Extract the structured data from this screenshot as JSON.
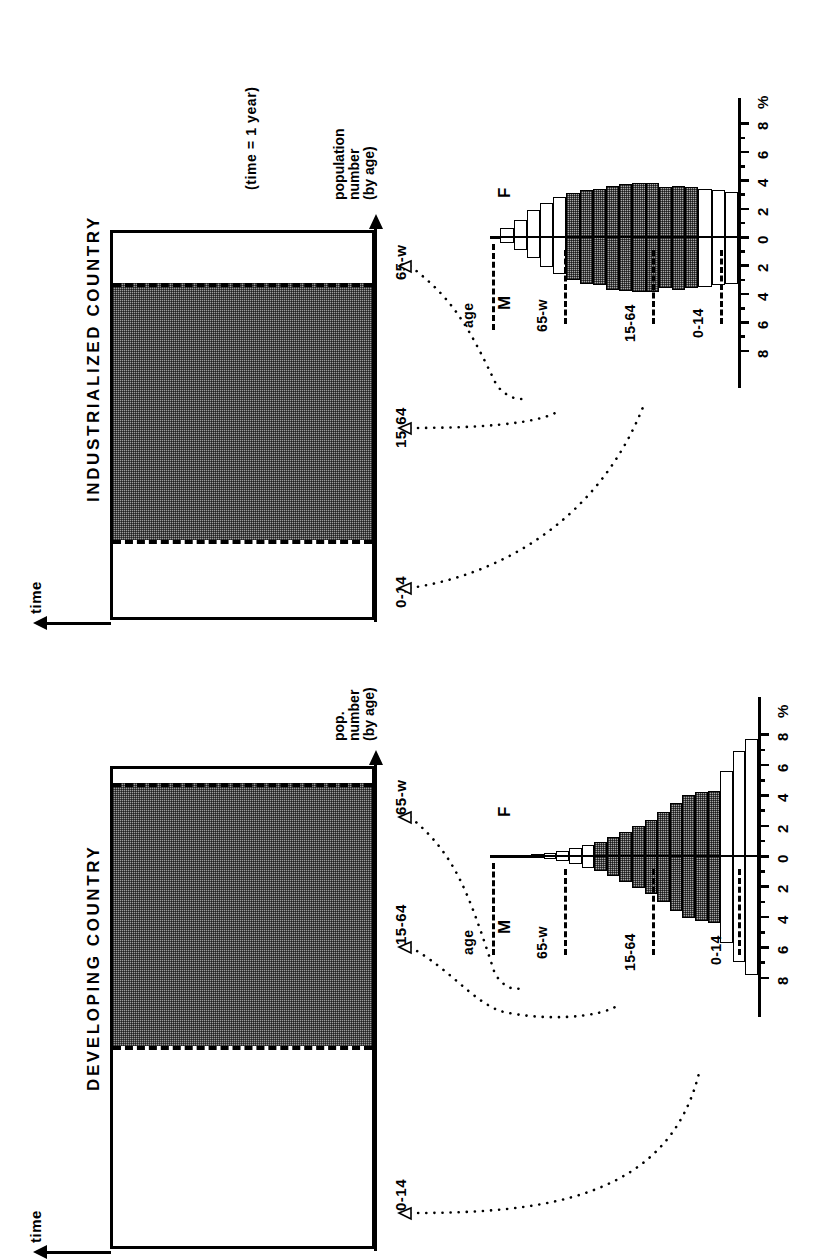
{
  "figure": {
    "type": "population-age-structure-diagram",
    "note": "(time = 1 year)"
  },
  "panels": [
    {
      "id": "industrialized",
      "title": "INDUSTRIALIZED COUNTRY",
      "time_axis_label": "time",
      "value_axis_label_line1": "population",
      "value_axis_label_line2": "number",
      "value_axis_label_line3": "(by age)",
      "categories": [
        "0-14",
        "15-64",
        "65-w"
      ],
      "segment_shares": [
        0.2,
        0.67,
        0.13
      ],
      "segment_fill": [
        "white",
        "shaded",
        "white"
      ],
      "pyramid": {
        "sex_left_label": "M",
        "sex_right_label": "F",
        "age_axis_label": "age",
        "percent_axis_label": "%",
        "tick_labels": [
          "8",
          "6",
          "4",
          "2",
          "0",
          "2",
          "4",
          "6",
          "8"
        ],
        "group_labels": [
          "0-14",
          "15-64",
          "65-w"
        ]
      }
    },
    {
      "id": "developing",
      "title": "DEVELOPING COUNTRY",
      "time_axis_label": "time",
      "value_axis_label_line1": "pop.",
      "value_axis_label_line2": "number",
      "value_axis_label_line3": "(by age)",
      "categories": [
        "0-14",
        "15-64",
        "65-w"
      ],
      "segment_shares": [
        0.42,
        0.55,
        0.03
      ],
      "segment_fill": [
        "white",
        "shaded",
        "white"
      ],
      "pyramid": {
        "sex_left_label": "M",
        "sex_right_label": "F",
        "age_axis_label": "age",
        "percent_axis_label": "%",
        "tick_labels": [
          "8",
          "6",
          "4",
          "2",
          "0",
          "2",
          "4",
          "6",
          "8"
        ],
        "group_labels": [
          "0-14",
          "15-64",
          "65-w"
        ]
      }
    }
  ],
  "chart_data": [
    {
      "type": "bar",
      "id": "industrialized-population-pyramid",
      "title": "INDUSTRIALIZED COUNTRY",
      "xlabel": "%",
      "ylabel": "age",
      "xlim": [
        -8,
        8
      ],
      "grid": false,
      "legend": [
        "M",
        "F"
      ],
      "categories": [
        "0-4",
        "5-9",
        "10-14",
        "15-19",
        "20-24",
        "25-29",
        "30-34",
        "35-39",
        "40-44",
        "45-49",
        "50-54",
        "55-59",
        "60-64",
        "65-69",
        "70-74",
        "75-79",
        "80-84",
        "85-w"
      ],
      "group_of_category": [
        "0-14",
        "0-14",
        "0-14",
        "15-64",
        "15-64",
        "15-64",
        "15-64",
        "15-64",
        "15-64",
        "15-64",
        "15-64",
        "15-64",
        "15-64",
        "65-w",
        "65-w",
        "65-w",
        "65-w",
        "65-w"
      ],
      "series": [
        {
          "name": "M",
          "values": [
            3.3,
            3.4,
            3.5,
            3.6,
            3.7,
            3.6,
            3.9,
            3.9,
            3.8,
            3.7,
            3.4,
            3.3,
            3.0,
            2.6,
            2.1,
            1.5,
            0.9,
            0.4
          ]
        },
        {
          "name": "F",
          "values": [
            3.2,
            3.3,
            3.4,
            3.5,
            3.6,
            3.5,
            3.8,
            3.8,
            3.7,
            3.6,
            3.4,
            3.3,
            3.1,
            2.8,
            2.4,
            1.9,
            1.2,
            0.6
          ]
        }
      ]
    },
    {
      "type": "bar",
      "id": "developing-population-pyramid",
      "title": "DEVELOPING COUNTRY",
      "xlabel": "%",
      "ylabel": "age",
      "xlim": [
        -8,
        8
      ],
      "grid": false,
      "legend": [
        "M",
        "F"
      ],
      "categories": [
        "0-4",
        "5-9",
        "10-14",
        "15-19",
        "20-24",
        "25-29",
        "30-34",
        "35-39",
        "40-44",
        "45-49",
        "50-54",
        "55-59",
        "60-64",
        "65-69",
        "70-74",
        "75-79",
        "80-84",
        "85-w"
      ],
      "group_of_category": [
        "0-14",
        "0-14",
        "0-14",
        "15-64",
        "15-64",
        "15-64",
        "15-64",
        "15-64",
        "15-64",
        "15-64",
        "15-64",
        "15-64",
        "15-64",
        "65-w",
        "65-w",
        "65-w",
        "65-w",
        "65-w"
      ],
      "series": [
        {
          "name": "M",
          "values": [
            7.8,
            7.0,
            5.7,
            4.4,
            4.3,
            4.1,
            3.6,
            3.0,
            2.5,
            2.1,
            1.7,
            1.3,
            1.0,
            0.8,
            0.5,
            0.35,
            0.2,
            0.1
          ]
        },
        {
          "name": "F",
          "values": [
            7.7,
            6.9,
            5.6,
            4.3,
            4.2,
            4.0,
            3.5,
            2.9,
            2.4,
            2.0,
            1.6,
            1.25,
            0.95,
            0.75,
            0.5,
            0.33,
            0.18,
            0.1
          ]
        }
      ]
    },
    {
      "type": "bar",
      "id": "industrialized-age-structure-box",
      "title": "INDUSTRIALIZED COUNTRY",
      "xlabel": "population number (by age)",
      "ylabel": "time",
      "categories": [
        "0-14",
        "15-64",
        "65-w"
      ],
      "values": [
        20,
        67,
        13
      ],
      "ylim": [
        0,
        100
      ]
    },
    {
      "type": "bar",
      "id": "developing-age-structure-box",
      "title": "DEVELOPING COUNTRY",
      "xlabel": "pop. number (by age)",
      "ylabel": "time",
      "categories": [
        "0-14",
        "15-64",
        "65-w"
      ],
      "values": [
        42,
        55,
        3
      ],
      "ylim": [
        0,
        100
      ]
    }
  ]
}
